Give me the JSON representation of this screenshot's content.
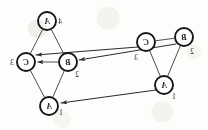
{
  "figure": {
    "orientation": "mirrored",
    "background_color": "#fdfdfb",
    "ink_color": "#1a1a1a"
  },
  "style": {
    "node_radius": 9,
    "node_stroke": "#161616",
    "node_fill": "#ffffff",
    "node_stroke_width": 1.9,
    "edge_color": "#3a3a3a",
    "edge_width": 0.9,
    "map_arrow_color": "#2b2b2b",
    "map_arrow_width": 1.0,
    "node_font_size": 8,
    "index_font_size": 7.5
  },
  "graphs": [
    {
      "id": "target-graph",
      "name": "left-graph",
      "nodes": [
        {
          "id": "L-A4",
          "letter": "A",
          "index": "4",
          "cx": 47,
          "cy": 21,
          "index_dx": 13,
          "index_dy": 3
        },
        {
          "id": "L-C3",
          "letter": "C",
          "index": "3",
          "cx": 26,
          "cy": 62,
          "index_dx": -14,
          "index_dy": 3
        },
        {
          "id": "L-B2",
          "letter": "B",
          "index": "2",
          "cx": 68,
          "cy": 62,
          "index_dx": 9,
          "index_dy": 15
        },
        {
          "id": "L-A1",
          "letter": "A",
          "index": "1",
          "cx": 49,
          "cy": 106,
          "index_dx": 12,
          "index_dy": 9
        }
      ],
      "edges": [
        {
          "from": "L-A4",
          "to": "L-C3"
        },
        {
          "from": "L-A4",
          "to": "L-B2"
        },
        {
          "from": "L-B2",
          "to": "L-C3",
          "directed": true
        },
        {
          "from": "L-A1",
          "to": "L-C3"
        },
        {
          "from": "L-A1",
          "to": "L-B2"
        }
      ]
    },
    {
      "id": "source-graph",
      "name": "right-graph",
      "nodes": [
        {
          "id": "R-C3",
          "letter": "C",
          "index": "3",
          "cx": 146,
          "cy": 42,
          "index_dx": -10,
          "index_dy": 18
        },
        {
          "id": "R-B2",
          "letter": "B",
          "index": "2",
          "cx": 184,
          "cy": 37,
          "index_dx": 8,
          "index_dy": 17
        },
        {
          "id": "R-A1",
          "letter": "A",
          "index": "1",
          "cx": 164,
          "cy": 85,
          "index_dx": 10,
          "index_dy": 14
        }
      ],
      "edges": [
        {
          "from": "R-C3",
          "to": "R-B2"
        },
        {
          "from": "R-C3",
          "to": "R-A1"
        },
        {
          "from": "R-B2",
          "to": "R-A1"
        }
      ]
    }
  ],
  "mapping_arrows": [
    {
      "id": "map-C",
      "label": "",
      "from": "R-C3",
      "to": "L-C3",
      "x1": 138,
      "y1": 47,
      "x2": 36,
      "y2": 55
    },
    {
      "id": "map-B",
      "label": "",
      "from": "R-B2",
      "to": "L-B2",
      "x1": 176,
      "y1": 44,
      "x2": 79,
      "y2": 60
    },
    {
      "id": "map-A",
      "label": "",
      "from": "R-A1",
      "to": "L-A1",
      "x1": 156,
      "y1": 90,
      "x2": 61,
      "y2": 103
    }
  ],
  "labels": {
    "node_letters": [
      "A",
      "B",
      "C"
    ],
    "node_indices": [
      "1",
      "2",
      "3",
      "4"
    ]
  }
}
